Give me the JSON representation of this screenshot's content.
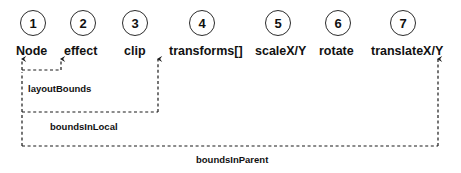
{
  "diagram": {
    "background_color": "#ffffff",
    "line_color": "#1a1a1a",
    "text_color": "#111111",
    "steps": [
      {
        "number": "1",
        "label": "Node",
        "circle_cx": 33,
        "circle_cy": 23,
        "label_x": 16,
        "label_y": 45
      },
      {
        "number": "2",
        "label": "effect",
        "circle_cx": 83,
        "circle_cy": 23,
        "label_x": 64,
        "label_y": 45
      },
      {
        "number": "3",
        "label": "clip",
        "circle_cx": 135,
        "circle_cy": 23,
        "label_x": 124,
        "label_y": 45
      },
      {
        "number": "4",
        "label": "transforms[]",
        "circle_cx": 202,
        "circle_cy": 23,
        "label_x": 169,
        "label_y": 45
      },
      {
        "number": "5",
        "label": "scaleX/Y",
        "circle_cx": 278,
        "circle_cy": 23,
        "label_x": 255,
        "label_y": 45
      },
      {
        "number": "6",
        "label": "rotate",
        "circle_cx": 338,
        "circle_cy": 23,
        "label_x": 319,
        "label_y": 45
      },
      {
        "number": "7",
        "label": "translateX/Y",
        "circle_cx": 403,
        "circle_cy": 23,
        "label_x": 371,
        "label_y": 45
      }
    ],
    "brackets": [
      {
        "name": "layoutBounds",
        "label": "layoutBounds",
        "label_x": 28,
        "label_y": 84,
        "left_x": 22,
        "right_x": 61,
        "bottom_y": 70,
        "arrow_top_y": 57
      },
      {
        "name": "boundsInLocal",
        "label": "boundsInLocal",
        "label_x": 50,
        "label_y": 122,
        "left_x": 22,
        "right_x": 158,
        "bottom_y": 112,
        "arrow_top_y": 57
      },
      {
        "name": "boundsInParent",
        "label": "boundsInParent",
        "label_x": 196,
        "label_y": 155,
        "left_x": 22,
        "right_x": 438,
        "bottom_y": 146,
        "arrow_top_y": 57
      }
    ]
  }
}
